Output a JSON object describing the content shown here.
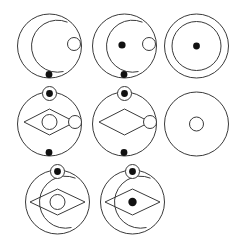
{
  "figure": {
    "grid": {
      "rows": 3,
      "columns": 3,
      "cells_filled": 8,
      "empty_cell": "row3-col3"
    },
    "colors": {
      "background": "#ffffff",
      "stroke": "#3a3a3a",
      "dot_fill": "#111111",
      "open_fill": "#ffffff"
    },
    "panels": [
      {
        "id": "panel-1",
        "position": "row1-col1",
        "label": "Panel 1",
        "outer_circle": "full",
        "inner_ring": "arc-open-right",
        "center_mark": "none",
        "top_mark": "none",
        "right_mark": "open-circle",
        "bottom_mark": "filled-dot",
        "diamond": "none"
      },
      {
        "id": "panel-2",
        "position": "row1-col2",
        "label": "Panel 2",
        "outer_circle": "full",
        "inner_ring": "arc-open-right",
        "center_mark": "filled-dot",
        "top_mark": "none",
        "right_mark": "open-circle",
        "bottom_mark": "filled-dot",
        "diamond": "none"
      },
      {
        "id": "panel-3",
        "position": "row1-col3",
        "label": "Panel 3",
        "outer_circle": "full",
        "inner_ring": "full-circle",
        "center_mark": "filled-dot",
        "top_mark": "none",
        "right_mark": "none",
        "bottom_mark": "none",
        "diamond": "none"
      },
      {
        "id": "panel-4",
        "position": "row2-col1",
        "label": "Panel 4",
        "outer_circle": "full",
        "inner_ring": "none",
        "center_mark": "open-circle",
        "top_mark": "circled-dot",
        "right_mark": "open-circle",
        "bottom_mark": "filled-dot",
        "diamond": "full"
      },
      {
        "id": "panel-5",
        "position": "row2-col2",
        "label": "Panel 5",
        "outer_circle": "full",
        "inner_ring": "none",
        "center_mark": "none",
        "top_mark": "circled-dot",
        "right_mark": "open-circle",
        "bottom_mark": "filled-dot",
        "diamond": "full"
      },
      {
        "id": "panel-6",
        "position": "row2-col3",
        "label": "Panel 6",
        "outer_circle": "full",
        "inner_ring": "none",
        "center_mark": "open-circle",
        "top_mark": "none",
        "right_mark": "none",
        "bottom_mark": "none",
        "diamond": "none"
      },
      {
        "id": "panel-7",
        "position": "row3-col1",
        "label": "Panel 7",
        "outer_circle": "full",
        "inner_ring": "arc-open-right",
        "center_mark": "open-circle",
        "top_mark": "circled-dot",
        "right_mark": "none",
        "bottom_mark": "none",
        "diamond": "full"
      },
      {
        "id": "panel-8",
        "position": "row3-col2",
        "label": "Panel 8",
        "outer_circle": "full",
        "inner_ring": "arc-open-right",
        "center_mark": "filled-dot",
        "top_mark": "circled-dot",
        "right_mark": "none",
        "bottom_mark": "none",
        "diamond": "full"
      }
    ]
  }
}
